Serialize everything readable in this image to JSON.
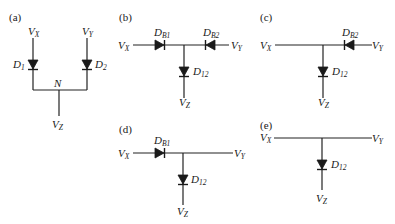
{
  "figure": {
    "panels": [
      {
        "id": "a",
        "label": "(a)",
        "nodes": {
          "vx": "V",
          "vx_sub": "X",
          "vy": "V",
          "vy_sub": "Y",
          "vz": "V",
          "vz_sub": "Z",
          "n": "N"
        },
        "diodes": [
          {
            "name": "D",
            "sub": "1",
            "direction": "down"
          },
          {
            "name": "D",
            "sub": "2",
            "direction": "down"
          }
        ]
      },
      {
        "id": "b",
        "label": "(b)",
        "nodes": {
          "vx": "V",
          "vx_sub": "X",
          "vy": "V",
          "vy_sub": "Y",
          "vz": "V",
          "vz_sub": "Z"
        },
        "diodes": [
          {
            "name": "D",
            "sub": "B1",
            "direction": "right"
          },
          {
            "name": "D",
            "sub": "B2",
            "direction": "left"
          },
          {
            "name": "D",
            "sub": "12",
            "direction": "down"
          }
        ]
      },
      {
        "id": "c",
        "label": "(c)",
        "nodes": {
          "vx": "V",
          "vx_sub": "X",
          "vy": "V",
          "vy_sub": "Y",
          "vz": "V",
          "vz_sub": "Z"
        },
        "diodes": [
          {
            "name": "D",
            "sub": "B2",
            "direction": "left"
          },
          {
            "name": "D",
            "sub": "12",
            "direction": "down"
          }
        ]
      },
      {
        "id": "d",
        "label": "(d)",
        "nodes": {
          "vx": "V",
          "vx_sub": "X",
          "vy": "V",
          "vy_sub": "Y",
          "vz": "V",
          "vz_sub": "Z"
        },
        "diodes": [
          {
            "name": "D",
            "sub": "B1",
            "direction": "right"
          },
          {
            "name": "D",
            "sub": "12",
            "direction": "down"
          }
        ]
      },
      {
        "id": "e",
        "label": "(e)",
        "nodes": {
          "vx": "V",
          "vx_sub": "X",
          "vy": "V",
          "vy_sub": "Y",
          "vz": "V",
          "vz_sub": "Z"
        },
        "diodes": [
          {
            "name": "D",
            "sub": "12",
            "direction": "down"
          }
        ]
      }
    ]
  }
}
